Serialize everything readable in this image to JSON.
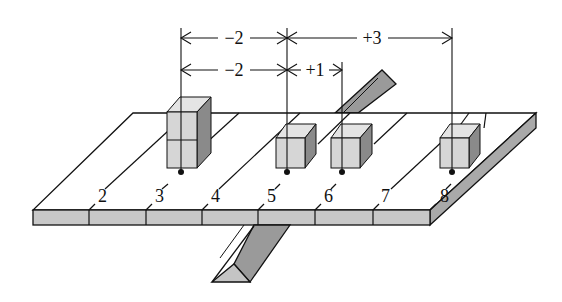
{
  "diagram": {
    "title": "",
    "position_labels": [
      "2",
      "3",
      "4",
      "5",
      "6",
      "7",
      "8"
    ],
    "cubes": [
      {
        "position": "3",
        "count": 2
      },
      {
        "position": "5",
        "count": 1
      },
      {
        "position": "6",
        "count": 1
      },
      {
        "position": "8",
        "count": 1
      }
    ],
    "dimensions": {
      "top_row": [
        {
          "from": "3",
          "to": "5",
          "label": "−2"
        },
        {
          "from": "5",
          "to": "8",
          "label": "+3"
        }
      ],
      "second_row": [
        {
          "from": "3",
          "to": "5",
          "label": "−2"
        },
        {
          "from": "5",
          "to": "6",
          "label": "+1"
        }
      ]
    },
    "colors": {
      "line": "#111111",
      "board_top": "#ffffff",
      "board_front": "#c8c8c8",
      "board_side": "#a9a9a9",
      "cube_front": "#d6d6d6",
      "cube_top": "#e4e4e4",
      "cube_side": "#8a8a8a",
      "fulcrum_face": "#9a9a9a",
      "fulcrum_end": "#c4c4c4"
    }
  }
}
